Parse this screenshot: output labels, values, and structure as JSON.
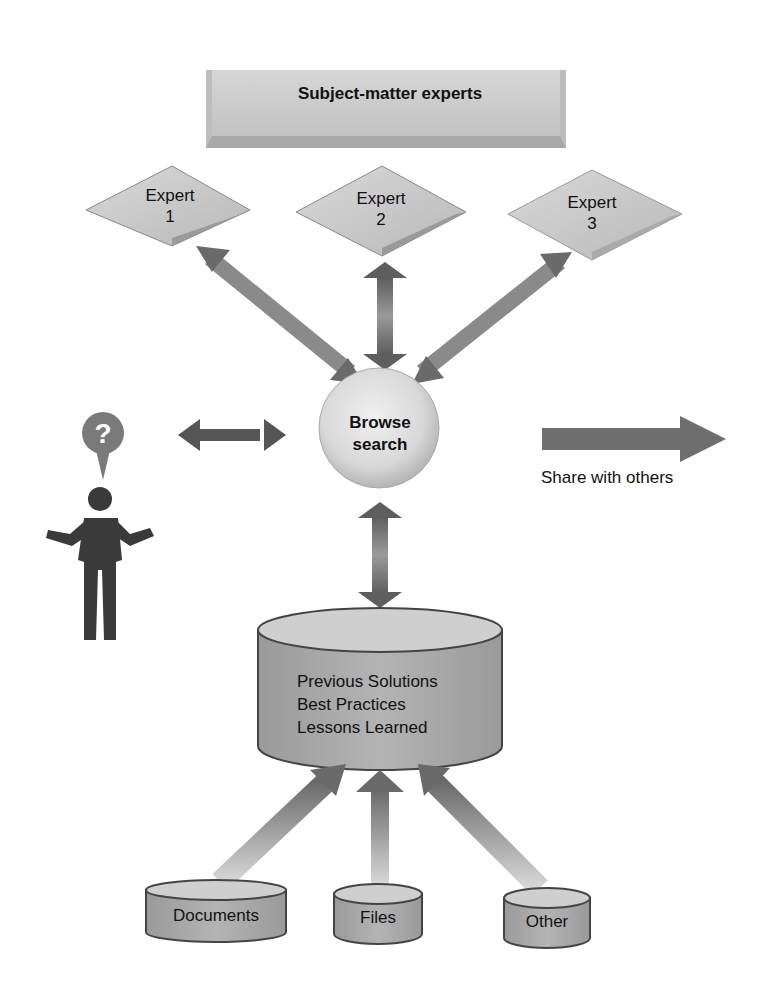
{
  "header": {
    "title": "Subject-matter experts"
  },
  "experts": [
    {
      "line1": "Expert",
      "line2": "1"
    },
    {
      "line1": "Expert",
      "line2": "2"
    },
    {
      "line1": "Expert",
      "line2": "3"
    }
  ],
  "hub": {
    "line1": "Browse",
    "line2": "search"
  },
  "share": {
    "label": "Share with others"
  },
  "user": {
    "bubble_glyph": "?",
    "icon": "person-question-icon"
  },
  "repository": {
    "lines": [
      "Previous Solutions",
      "Best Practices",
      "Lessons Learned"
    ]
  },
  "sources": [
    {
      "label": "Documents"
    },
    {
      "label": "Files"
    },
    {
      "label": "Other"
    }
  ],
  "colors": {
    "background": "#ffffff",
    "box_fill": "#c8c8c8",
    "diamond_fill": "#c4c4c4",
    "arrow_dark": "#555555",
    "arrow_light": "#bdbdbd",
    "cylinder_fill": "#a8a8a8",
    "person": "#3a3a3a",
    "bubble": "#7a7a7a"
  }
}
